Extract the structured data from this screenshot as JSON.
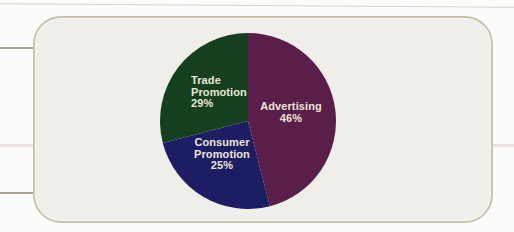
{
  "page": {
    "background": "#fcfcfa"
  },
  "panel": {
    "background": "#f0eee8",
    "border_color": "#ccc3ad"
  },
  "chart_data": {
    "type": "pie",
    "title": "",
    "start_angle_deg": 0,
    "direction": "clockwise",
    "label_text_color": "#ece5d6",
    "slices": [
      {
        "label": "Advertising",
        "value": 46,
        "pct_label": "46%",
        "color": "#5a1e4b"
      },
      {
        "label": "Consumer Promotion",
        "value": 25,
        "pct_label": "25%",
        "color": "#1d1d64"
      },
      {
        "label": "Trade Promotion",
        "value": 29,
        "pct_label": "29%",
        "color": "#15401f"
      }
    ]
  }
}
